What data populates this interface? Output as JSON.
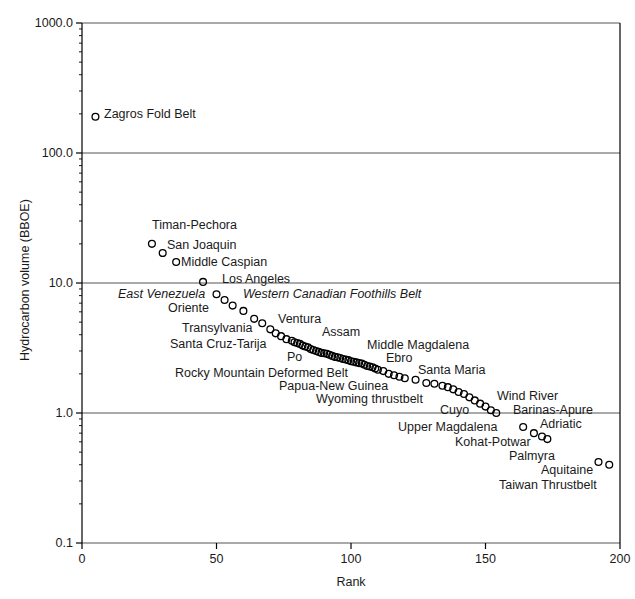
{
  "chart_data": {
    "type": "scatter",
    "title": "",
    "xlabel": "Rank",
    "ylabel": "Hydrocarbon volume (BBOE)",
    "xlim": [
      0,
      200
    ],
    "ylim": [
      0.1,
      1000
    ],
    "yscale": "log",
    "xscale": "linear",
    "grid": "horizontal-major-only",
    "legend": "none",
    "marker": "open-circle",
    "xticks": [
      0,
      50,
      100,
      150,
      200
    ],
    "xticklabels": [
      "0",
      "50",
      "100",
      "150",
      "200"
    ],
    "yticks": [
      0.1,
      1.0,
      10.0,
      100.0,
      1000.0
    ],
    "yticklabels": [
      "0.1",
      "1.0",
      "10.0",
      "100.0",
      "1000.0"
    ],
    "x": [
      5,
      26,
      30,
      35,
      45,
      50,
      53,
      56,
      60,
      64,
      67,
      70,
      72,
      74,
      76,
      78,
      79,
      80,
      81,
      82,
      83,
      84,
      85,
      86,
      87,
      88,
      89,
      90,
      91,
      92,
      93,
      94,
      95,
      96,
      97,
      98,
      99,
      100,
      101,
      102,
      103,
      104,
      105,
      106,
      107,
      108,
      109,
      110,
      112,
      114,
      116,
      118,
      120,
      124,
      128,
      131,
      134,
      136,
      138,
      140,
      142,
      144,
      146,
      148,
      150,
      152,
      154,
      164,
      168,
      171,
      173,
      192,
      196
    ],
    "y": [
      190,
      20,
      17,
      14.5,
      10.2,
      8.2,
      7.4,
      6.7,
      6.1,
      5.3,
      4.9,
      4.4,
      4.1,
      3.9,
      3.7,
      3.6,
      3.5,
      3.45,
      3.4,
      3.3,
      3.25,
      3.2,
      3.1,
      3.05,
      3.0,
      2.95,
      2.9,
      2.88,
      2.85,
      2.8,
      2.75,
      2.7,
      2.68,
      2.65,
      2.6,
      2.58,
      2.55,
      2.5,
      2.48,
      2.45,
      2.42,
      2.4,
      2.35,
      2.3,
      2.28,
      2.25,
      2.2,
      2.15,
      2.1,
      2.0,
      1.95,
      1.9,
      1.85,
      1.8,
      1.7,
      1.68,
      1.62,
      1.58,
      1.52,
      1.45,
      1.4,
      1.32,
      1.25,
      1.18,
      1.12,
      1.05,
      1.0,
      0.78,
      0.7,
      0.66,
      0.63,
      0.42,
      0.4
    ],
    "annotations": [
      {
        "text": "Zagros Fold Belt",
        "x": 104,
        "y": 108,
        "italic": false
      },
      {
        "text": "Timan-Pechora",
        "x": 152,
        "y": 219,
        "italic": false
      },
      {
        "text": "San Joaquin",
        "x": 167,
        "y": 239,
        "italic": false
      },
      {
        "text": "Middle Caspian",
        "x": 181,
        "y": 256,
        "italic": false
      },
      {
        "text": "Los Angeles",
        "x": 222,
        "y": 273,
        "italic": false
      },
      {
        "text": "East Venezuela",
        "x": 118,
        "y": 288,
        "italic": true
      },
      {
        "text": "Western Canadian Foothills Belt",
        "x": 243,
        "y": 288,
        "italic": true
      },
      {
        "text": "Oriente",
        "x": 168,
        "y": 302,
        "italic": false
      },
      {
        "text": "Ventura",
        "x": 278,
        "y": 313,
        "italic": false
      },
      {
        "text": "Transylvania",
        "x": 182,
        "y": 322,
        "italic": false
      },
      {
        "text": "Assam",
        "x": 322,
        "y": 326,
        "italic": false
      },
      {
        "text": "Middle Magdalena",
        "x": 367,
        "y": 339,
        "italic": false
      },
      {
        "text": "Santa Cruz-Tarija",
        "x": 170,
        "y": 338,
        "italic": false
      },
      {
        "text": "Po",
        "x": 287,
        "y": 351,
        "italic": false
      },
      {
        "text": "Ebro",
        "x": 386,
        "y": 352,
        "italic": false
      },
      {
        "text": "Santa Maria",
        "x": 418,
        "y": 364,
        "italic": false
      },
      {
        "text": "Rocky Mountain Deformed Belt",
        "x": 175,
        "y": 367,
        "italic": false
      },
      {
        "text": "Papua-New Guinea",
        "x": 279,
        "y": 380,
        "italic": false
      },
      {
        "text": "Wind River",
        "x": 497,
        "y": 390,
        "italic": false
      },
      {
        "text": "Wyoming thrustbelt",
        "x": 316,
        "y": 393,
        "italic": false
      },
      {
        "text": "Cuyo",
        "x": 440,
        "y": 404,
        "italic": false
      },
      {
        "text": "Barinas-Apure",
        "x": 513,
        "y": 404,
        "italic": false
      },
      {
        "text": "Adriatic",
        "x": 540,
        "y": 418,
        "italic": false
      },
      {
        "text": "Upper Magdalena",
        "x": 398,
        "y": 421,
        "italic": false
      },
      {
        "text": "Kohat-Potwar",
        "x": 455,
        "y": 436,
        "italic": false
      },
      {
        "text": "Palmyra",
        "x": 509,
        "y": 450,
        "italic": false
      },
      {
        "text": "Aquitaine",
        "x": 541,
        "y": 464,
        "italic": false
      },
      {
        "text": "Taiwan Thrustbelt",
        "x": 499,
        "y": 479,
        "italic": false
      }
    ]
  },
  "axis": {
    "x_title": "Rank",
    "y_title": "Hydrocarbon volume (BBOE)"
  },
  "colors": {
    "axis": "#000000",
    "grid": "#555555",
    "marker": "#000000",
    "text": "#1a1a1a"
  }
}
